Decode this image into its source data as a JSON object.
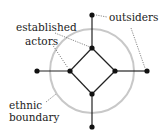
{
  "labels": {
    "outsiders": "outsiders",
    "established_line1": "established",
    "established_line2": "actors",
    "boundary_line1": "ethnic",
    "boundary_line2": "boundary"
  },
  "colors": {
    "node": "#111111",
    "edge": "#222222",
    "circle": "#c8c8c8",
    "leader": "#555555"
  },
  "nodes": {
    "inner": [
      {
        "id": "top",
        "x": 92,
        "y": 48
      },
      {
        "id": "right",
        "x": 115,
        "y": 71
      },
      {
        "id": "bottom",
        "x": 92,
        "y": 94
      },
      {
        "id": "left",
        "x": 70,
        "y": 71
      }
    ],
    "outer": [
      {
        "id": "top",
        "x": 92,
        "y": 15
      },
      {
        "id": "right",
        "x": 147,
        "y": 71
      },
      {
        "id": "bottom",
        "x": 92,
        "y": 127
      },
      {
        "id": "left",
        "x": 37,
        "y": 71
      }
    ]
  },
  "boundary_circle": {
    "cx": 92,
    "cy": 71,
    "r": 42
  }
}
